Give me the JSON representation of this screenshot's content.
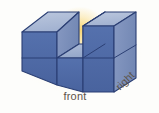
{
  "figure": {
    "labels": {
      "front": "front",
      "right": "right"
    },
    "colors": {
      "background": "#fdfdfb",
      "glow": "#f7ce5a",
      "top_face": "#a9b8d4",
      "top_face_light": "#b6c3da",
      "front_face": "#4f6aa8",
      "front_face_alt": "#5470ae",
      "side_face": "#7f93bd",
      "side_face_alt": "#8a9cc4",
      "notch_floor": "#9fb0cf",
      "edge_stroke": "#2b3f74",
      "label_text": "#5d544a"
    },
    "geometry": {
      "columns": 3,
      "rows": 2,
      "removed_cubes": [
        "top-middle"
      ],
      "projection": "isometric"
    }
  }
}
